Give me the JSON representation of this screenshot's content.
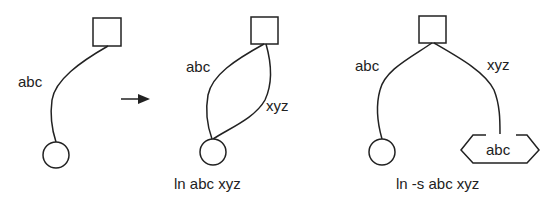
{
  "diagram": {
    "before": {
      "link_label": "abc"
    },
    "hard_link": {
      "link_label_1": "abc",
      "link_label_2": "xyz",
      "caption": "ln abc xyz"
    },
    "symbolic_link": {
      "link_label_1": "abc",
      "link_label_2": "xyz",
      "symlink_target": "abc",
      "caption": "ln -s abc xyz"
    },
    "colors": {
      "stroke": "#222222",
      "background": "#ffffff"
    }
  }
}
